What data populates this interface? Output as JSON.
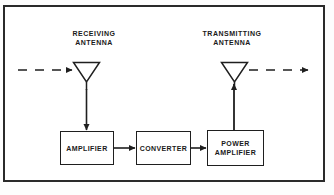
{
  "diagram": {
    "frame": {
      "border_color": "#2a2a2a",
      "background": "#ffffff"
    },
    "labels": {
      "receiving_antenna": "RECEIVING\nANTENNA",
      "transmitting_antenna": "TRANSMITTING\nANTENNA"
    },
    "blocks": [
      {
        "id": "amplifier",
        "label": "AMPLIFIER"
      },
      {
        "id": "converter",
        "label": "CONVERTER"
      },
      {
        "id": "power_amplifier",
        "label": "POWER\nAMPLIFIER"
      }
    ],
    "antennas": [
      {
        "id": "receiving-antenna",
        "shape": "inverted-triangle-dipole"
      },
      {
        "id": "transmitting-antenna",
        "shape": "inverted-triangle-dipole"
      }
    ],
    "signal_paths": [
      {
        "id": "incoming-wave",
        "style": "dashed",
        "direction": "right",
        "terminator": "arrow"
      },
      {
        "id": "rx-antenna-to-amplifier",
        "style": "solid",
        "direction": "down",
        "terminator": "arrow"
      },
      {
        "id": "amplifier-to-converter",
        "style": "solid",
        "direction": "right",
        "terminator": "arrow"
      },
      {
        "id": "converter-to-power-amplifier",
        "style": "solid",
        "direction": "right",
        "terminator": "arrow"
      },
      {
        "id": "power-amplifier-to-tx-antenna",
        "style": "solid",
        "direction": "up",
        "terminator": "arrow"
      },
      {
        "id": "outgoing-wave",
        "style": "dashed",
        "direction": "right",
        "terminator": "arrow"
      }
    ],
    "colors": {
      "line": "#1f1f1f",
      "frame": "#2a2a2a",
      "text": "#1a1a1a",
      "background": "#ffffff"
    }
  }
}
